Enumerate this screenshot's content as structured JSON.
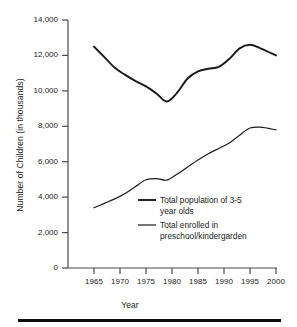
{
  "chart_data": {
    "type": "line",
    "title": "",
    "xlabel": "Year",
    "ylabel": "Number of Children (in thousands)",
    "xlim": [
      1960,
      2000
    ],
    "ylim": [
      0,
      14000
    ],
    "grid": false,
    "legend_position": "inside-center",
    "xticks": [
      "1965",
      "1970",
      "1975",
      "1980",
      "1985",
      "1990",
      "1995",
      "2000"
    ],
    "xtick_values": [
      1965,
      1970,
      1975,
      1980,
      1985,
      1990,
      1995,
      2000
    ],
    "yticks": [
      "0",
      "2,000",
      "4,000",
      "6,000",
      "8,000",
      "10,000",
      "12,000",
      "14,000"
    ],
    "ytick_values": [
      0,
      2000,
      4000,
      6000,
      8000,
      10000,
      12000,
      14000
    ],
    "x": [
      1965,
      1967,
      1969,
      1971,
      1973,
      1975,
      1977,
      1979,
      1981,
      1983,
      1985,
      1987,
      1989,
      1991,
      1993,
      1995,
      1997,
      2000
    ],
    "series": [
      {
        "name": "Total population of 3-5 year olds",
        "color": "#1a1a1a",
        "values": [
          12500,
          11900,
          11300,
          10900,
          10550,
          10250,
          9850,
          9400,
          9900,
          10700,
          11100,
          11250,
          11350,
          11800,
          12400,
          12600,
          12400,
          12000
        ]
      },
      {
        "name": "Total enrolled in preschool/kindergarden",
        "color": "#1a1a1a",
        "values": [
          3400,
          3650,
          3900,
          4200,
          4600,
          4980,
          5050,
          4960,
          5300,
          5700,
          6100,
          6450,
          6750,
          7050,
          7500,
          7900,
          7950,
          7800
        ]
      }
    ],
    "legend": [
      {
        "label": "Total population of 3-5\nyear olds",
        "marker": "line-thick"
      },
      {
        "label": "Total enrolled in\npreschool/kindergarden",
        "marker": "line-thin"
      }
    ]
  }
}
